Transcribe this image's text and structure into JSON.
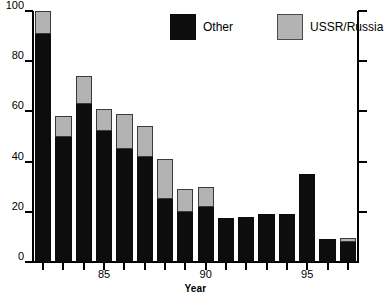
{
  "chart_data": {
    "type": "bar",
    "title": "",
    "subtitle": "",
    "xlabel": "Year",
    "ylabel": "",
    "ylim": [
      0,
      100
    ],
    "yticks": [
      0,
      20,
      40,
      60,
      80,
      100
    ],
    "ytick_labels": [
      "0",
      "20",
      "40",
      "60",
      "80",
      "100"
    ],
    "grid": false,
    "stacked": true,
    "legend_position": "top-center",
    "categories": [
      "82",
      "83",
      "84",
      "85",
      "86",
      "87",
      "88",
      "89",
      "90",
      "91",
      "92",
      "93",
      "94",
      "95",
      "96",
      "97"
    ],
    "xtick_labels": [
      "85",
      "90",
      "95"
    ],
    "xtick_categories": [
      "85",
      "90",
      "95"
    ],
    "series": [
      {
        "name": "Other",
        "color": "#0d0d0d",
        "values": [
          91,
          50,
          63,
          52,
          45,
          42,
          25,
          20,
          22,
          17.5,
          18,
          19,
          19,
          35,
          9,
          8
        ]
      },
      {
        "name": "USSR/Russia",
        "color": "#b3b3b3",
        "values": [
          9,
          8,
          11,
          9,
          14,
          12,
          16,
          9,
          8,
          0,
          0,
          0,
          0,
          0,
          0,
          1.5
        ]
      }
    ],
    "totals": [
      100,
      58,
      74,
      61,
      59,
      54,
      41,
      29,
      30,
      17.5,
      18,
      19,
      19,
      35,
      9,
      9.5
    ]
  },
  "legend": {
    "items": [
      {
        "label": "Other",
        "swatch": "black-square-icon"
      },
      {
        "label": "USSR/Russia",
        "swatch": "gray-square-icon"
      }
    ]
  },
  "axes": {
    "y_left_labels": [
      "100",
      "80",
      "60",
      "40",
      "20",
      "0"
    ],
    "x_labels": [
      "85",
      "90",
      "95"
    ],
    "x_title": "Year"
  }
}
